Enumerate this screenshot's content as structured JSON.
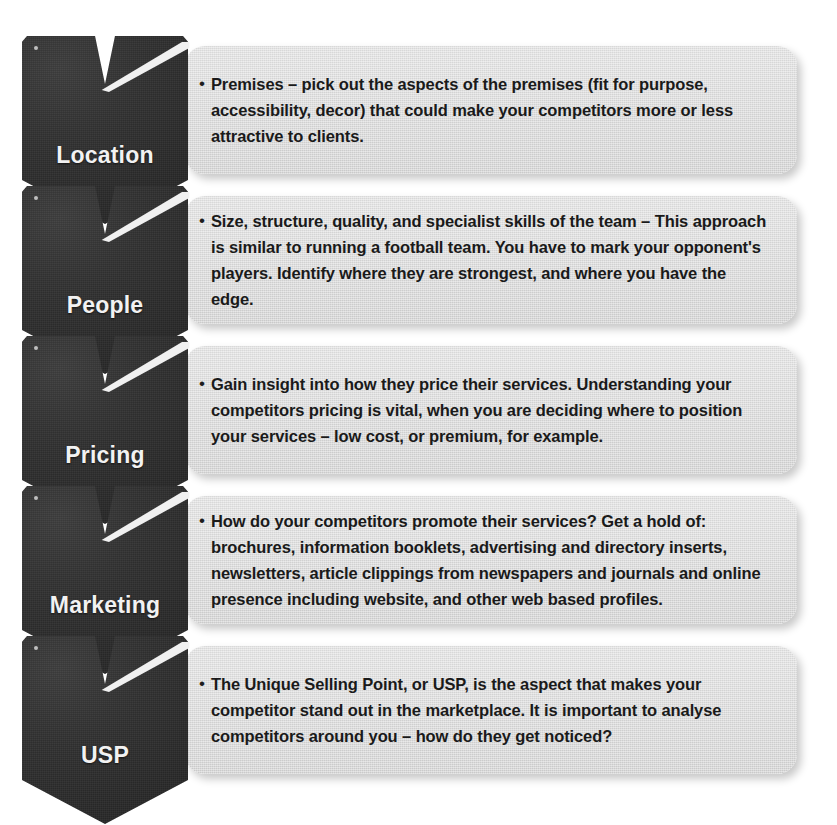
{
  "diagram": {
    "colors": {
      "badge_dark": "#2e2e2e",
      "badge_text": "#f2f2f2",
      "panel_bg": "#dcdcdc",
      "panel_text": "#1a1a1a",
      "page_bg": "#ffffff"
    },
    "bullet_glyph": "•",
    "rows": [
      {
        "label": "Location",
        "icon": "chevron-down-badge",
        "body": "Premises – pick out the aspects of the premises (fit for purpose, accessibility, decor) that could make your competitors more or less attractive to clients.",
        "lines": [
          "Premises – pick out the aspects of the premises (fit for purpose,",
          "accessibility, decor) that could make your competitors more or less",
          "attractive to clients."
        ]
      },
      {
        "label": "People",
        "icon": "chevron-down-badge",
        "body": "Size, structure, quality, and specialist skills of the team – This approach is similar to running a football team. You have to mark your opponent's players. Identify where they are strongest, and where you have the edge.",
        "lines": [
          "Size, structure, quality, and specialist skills of the team – This approach",
          "is similar to running a football team. You have to mark your",
          "opponent's players. Identify where they are strongest, and where",
          "you have the edge."
        ]
      },
      {
        "label": "Pricing",
        "icon": "chevron-down-badge",
        "body": "Gain insight into how they price their services. Understanding your competitors pricing is vital, when you are deciding where to position your services – low cost, or premium, for example.",
        "lines": [
          "Gain insight into how they price their services. Understanding your",
          "competitors pricing is vital, when you are deciding where to",
          "position your services – low cost, or premium, for example."
        ]
      },
      {
        "label": "Marketing",
        "icon": "chevron-down-badge",
        "body": "How do your competitors promote their services? Get a hold of: brochures, information booklets, advertising and directory inserts, newsletters, article clippings from newspapers and journals and online presence including website, and other web based profiles.",
        "lines": [
          "How do your competitors promote their services? Get a hold of:",
          "brochures, information booklets, advertising and directory inserts,",
          "newsletters, article clippings from newspapers and journals and online",
          "presence including website, and other web based profiles."
        ]
      },
      {
        "label": "USP",
        "icon": "chevron-down-badge",
        "body": "The Unique Selling Point, or USP, is the aspect that makes your competitor stand out in the marketplace. It is important to analyse competitors around you – how do they get noticed?",
        "lines": [
          "The Unique Selling Point, or USP, is the aspect that makes your",
          "competitor stand out in the marketplace. It is important to analyse",
          "competitors around you – how do they get noticed?"
        ]
      }
    ]
  }
}
